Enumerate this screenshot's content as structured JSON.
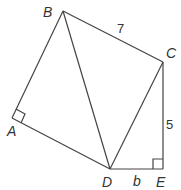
{
  "diagram": {
    "points": {
      "A": {
        "label": "A"
      },
      "B": {
        "label": "B"
      },
      "C": {
        "label": "C"
      },
      "D": {
        "label": "D"
      },
      "E": {
        "label": "E"
      }
    },
    "segment_labels": {
      "BC": "7",
      "CE": "5",
      "DE": "b"
    },
    "right_angles": [
      "A",
      "E"
    ]
  }
}
